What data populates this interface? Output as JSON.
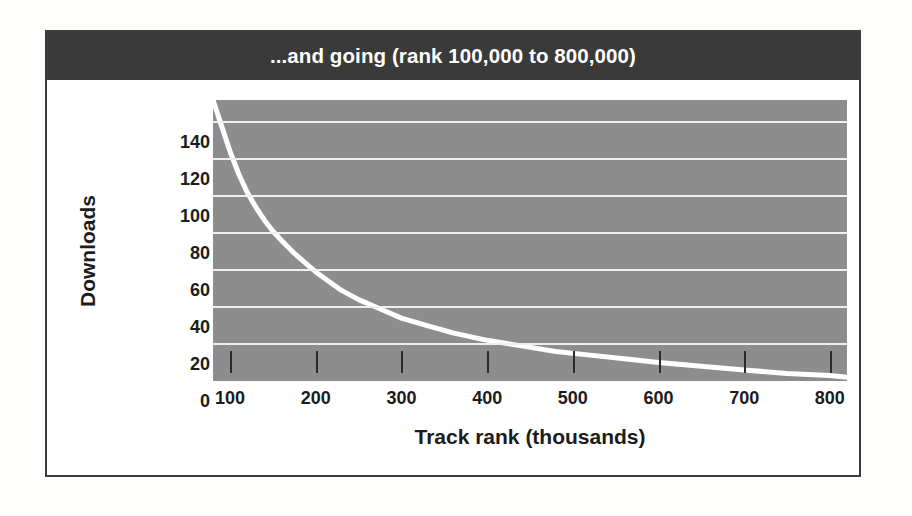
{
  "figure": {
    "title": "...and going (rank 100,000 to 800,000)",
    "title_bar_color": "#3a3a3a",
    "title_text_color": "#ffffff",
    "frame_border_color": "#3c3c3c",
    "page_background": "#fdfdfc"
  },
  "chart_data": {
    "type": "line",
    "title": "...and going (rank 100,000 to 800,000)",
    "xlabel": "Track rank (thousands)",
    "ylabel": "Downloads",
    "xlim": [
      80,
      820
    ],
    "ylim": [
      0,
      152
    ],
    "xticks": [
      100,
      200,
      300,
      400,
      500,
      600,
      700,
      800
    ],
    "xtick_labels": [
      "100",
      "200",
      "300",
      "400",
      "500",
      "600",
      "700",
      "800"
    ],
    "yticks": [
      0,
      20,
      40,
      60,
      80,
      100,
      120,
      140
    ],
    "ytick_labels": [
      "0",
      "20",
      "40",
      "60",
      "80",
      "100",
      "120",
      "140"
    ],
    "grid": "horizontal",
    "grid_color": "#efefef",
    "plot_background": "#8d8d8d",
    "legend": null,
    "series": [
      {
        "name": "Downloads by track rank",
        "color": "#ffffff",
        "line_width": 5,
        "x": [
          80,
          90,
          100,
          110,
          120,
          130,
          140,
          150,
          160,
          175,
          190,
          200,
          215,
          230,
          250,
          270,
          300,
          330,
          360,
          400,
          440,
          480,
          520,
          560,
          600,
          650,
          700,
          750,
          800,
          820
        ],
        "values": [
          152,
          138,
          124,
          112,
          102,
          94,
          87,
          81,
          76,
          69,
          63,
          59,
          54,
          49,
          44,
          40,
          34,
          30,
          26,
          22,
          19,
          16,
          14,
          12,
          10,
          8,
          6,
          4,
          3,
          2
        ]
      }
    ]
  }
}
